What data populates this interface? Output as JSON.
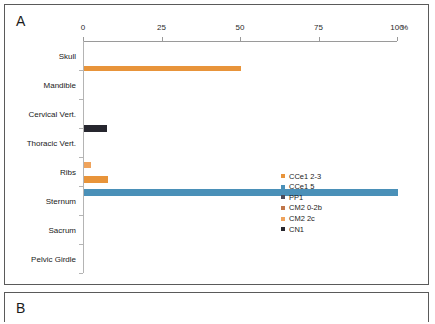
{
  "figure": {
    "panel_a_letter": "A",
    "panel_b_letter": "B"
  },
  "chart_data": {
    "type": "bar",
    "orientation": "horizontal",
    "title": "",
    "xlabel": "%",
    "ylabel": "",
    "xlim": [
      0,
      100
    ],
    "xticks": [
      0,
      25,
      50,
      75,
      100
    ],
    "xtick_labels": [
      "0",
      "25",
      "50",
      "75",
      "100"
    ],
    "x_unit": "%",
    "grid": false,
    "axis_position": "top",
    "legend_position": "right-bottom",
    "categories": [
      "Skull",
      "Mandible",
      "Cervical Vert.",
      "Thoracic Vert.",
      "Ribs",
      "Sternum",
      "Sacrum",
      "Pelvic Girdle"
    ],
    "series": [
      {
        "name": "CCe1 2-3",
        "color": "#E8943A",
        "values": [
          0,
          0,
          0,
          0,
          0,
          0,
          0,
          0
        ]
      },
      {
        "name": "CCe1 5",
        "color": "#4A90B8",
        "values": [
          0,
          0,
          0,
          0,
          0,
          100,
          0,
          0
        ]
      },
      {
        "name": "PP1",
        "color": "#4B4B5A",
        "values": [
          0,
          0,
          0,
          0,
          0,
          0,
          0,
          0
        ]
      },
      {
        "name": "CM2 0-2b",
        "color": "#C0764A",
        "values": [
          0,
          0,
          0,
          0,
          0,
          0,
          0,
          0
        ]
      },
      {
        "name": "CM2 2c",
        "color": "#EFA35C",
        "values": [
          0,
          50,
          0,
          0,
          2,
          0,
          0,
          0
        ]
      },
      {
        "name": "CN1",
        "color": "#26262E",
        "values": [
          0,
          0,
          0,
          7,
          0,
          0,
          0,
          0
        ]
      }
    ],
    "bars": [
      {
        "category": "Mandible",
        "series": "CM2 2c",
        "value": 50,
        "color": "#E8943A",
        "top_px": 24.5,
        "height_px": 5.5
      },
      {
        "category": "Thoracic Vert.",
        "series": "CN1",
        "value": 7.3,
        "color": "#26262E",
        "top_px": 84,
        "height_px": 7
      },
      {
        "category": "Ribs",
        "series": "CM2 2c",
        "value": 2.1,
        "color": "#EFA35C",
        "top_px": 121,
        "height_px": 6
      },
      {
        "category": "Ribs",
        "series": "CCe1 2-3",
        "value": 7.6,
        "color": "#E8943A",
        "top_px": 135,
        "height_px": 6.5
      },
      {
        "category": "Sternum",
        "series": "CCe1 5",
        "value": 100,
        "color": "#4A90B8",
        "top_px": 148,
        "height_px": 7
      }
    ],
    "legend": [
      {
        "label": "CCe1 2-3",
        "color": "#E8943A"
      },
      {
        "label": "CCe1 5",
        "color": "#4A90B8"
      },
      {
        "label": "PP1",
        "color": "#4B4B5A"
      },
      {
        "label": "CM2 0-2b",
        "color": "#C0764A"
      },
      {
        "label": "CM2 2c",
        "color": "#EFA35C"
      },
      {
        "label": "CN1",
        "color": "#26262E"
      }
    ]
  }
}
